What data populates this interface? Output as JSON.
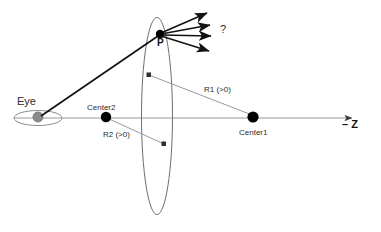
{
  "figure": {
    "background_color": "#ffffff",
    "width": 381,
    "height": 232
  },
  "colors": {
    "stroke_dark": "#1a1a1a",
    "stroke_gray": "#8c8c8c",
    "stroke_light": "#999999",
    "eye_fill": "#8a8a8a",
    "point_fill": "#000000",
    "text": "#2b2b2b"
  },
  "labels": {
    "eye": "Eye",
    "point_p": "P",
    "question": "?",
    "center1": "Center1",
    "center2": "Center2",
    "radius1": "R1 (>0)",
    "radius2": "R2 (>0)",
    "axis": "– Z"
  },
  "geometry": {
    "optical_axis": {
      "x1": 14,
      "y1": 118,
      "x2": 358,
      "y2": 118,
      "arrow_end": true
    },
    "lens_ellipse": {
      "cx": 157,
      "cy": 116,
      "rx": 16,
      "ry": 99
    },
    "eye": {
      "ellipse": {
        "cx": 38,
        "cy": 118,
        "rx": 24,
        "ry": 8
      },
      "pupil": {
        "cx": 38,
        "cy": 117,
        "r": 5
      }
    },
    "point_p": {
      "cx": 160,
      "cy": 34,
      "r": 4
    },
    "center1": {
      "cx": 253,
      "cy": 117,
      "r": 5
    },
    "center2": {
      "cx": 106,
      "cy": 117,
      "r": 5
    },
    "incident_ray": {
      "x1": 40,
      "y1": 117,
      "x2": 159,
      "y2": 35
    },
    "refracted_rays": [
      {
        "x1": 161,
        "y1": 34,
        "x2": 210,
        "y2": 13
      },
      {
        "x1": 161,
        "y1": 34,
        "x2": 213,
        "y2": 25
      },
      {
        "x1": 161,
        "y1": 34,
        "x2": 214,
        "y2": 36
      },
      {
        "x1": 161,
        "y1": 34,
        "x2": 212,
        "y2": 52
      }
    ],
    "radius1_line": {
      "x1": 149,
      "y1": 75,
      "x2": 252,
      "y2": 116,
      "marker": "square-start"
    },
    "radius2_line": {
      "x1": 107,
      "y1": 118,
      "x2": 164,
      "y2": 144,
      "marker": "square-end"
    }
  }
}
